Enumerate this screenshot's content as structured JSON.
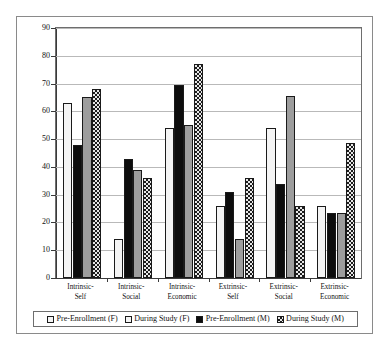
{
  "chart_data": {
    "type": "bar",
    "title": "",
    "subtitle": "",
    "xlabel": "",
    "ylabel": "",
    "ylim": [
      0,
      90
    ],
    "ytick_step": 10,
    "yticks": [
      "0",
      "10",
      "20",
      "30",
      "40",
      "50",
      "60",
      "70",
      "80",
      "90"
    ],
    "grid": true,
    "legend_position": "bottom",
    "categories": [
      "Intrinsic-\nSelf",
      "Intrinsic-\nSocial",
      "Intrinsic-\nEconomic",
      "Extrinsic-\nSelf",
      "Extrinsic-\nSocial",
      "Extrinsic-\nEconomic"
    ],
    "category_lines": [
      [
        "Intrinsic-",
        "Self"
      ],
      [
        "Intrinsic-",
        "Social"
      ],
      [
        "Intrinsic-",
        "Economic"
      ],
      [
        "Extrinsic-",
        "Self"
      ],
      [
        "Extrinsic-",
        "Social"
      ],
      [
        "Extrinsic-",
        "Economic"
      ]
    ],
    "series": [
      {
        "name": "Pre-Enrollment (F)",
        "fill": "white",
        "color": "#f4f4f4",
        "values": [
          63,
          14,
          54,
          26,
          54,
          26
        ]
      },
      {
        "name": "During Study (F)",
        "fill": "black",
        "color": "#0d0d0d",
        "values": [
          48,
          43,
          69.5,
          31,
          34,
          23.5
        ]
      },
      {
        "name": "Pre-Enrollment (M)",
        "fill": "gray",
        "color": "#9d9d9d",
        "values": [
          65,
          39,
          55,
          14,
          65.5,
          23.5
        ]
      },
      {
        "name": "During Study (M)",
        "fill": "checkered",
        "color": "#1d1d1d",
        "values": [
          68,
          36,
          77,
          36,
          26,
          48.5
        ]
      }
    ]
  },
  "legend": {
    "entries": [
      {
        "label": "Pre-Enrollment (F)",
        "swatch": "white-swatch"
      },
      {
        "label": "During Study (F)",
        "swatch": "white-swatch"
      },
      {
        "label": "Pre-Enrollment (M)",
        "swatch": "black-swatch"
      },
      {
        "label": "During Study (M)",
        "swatch": "checkered-swatch"
      }
    ]
  }
}
